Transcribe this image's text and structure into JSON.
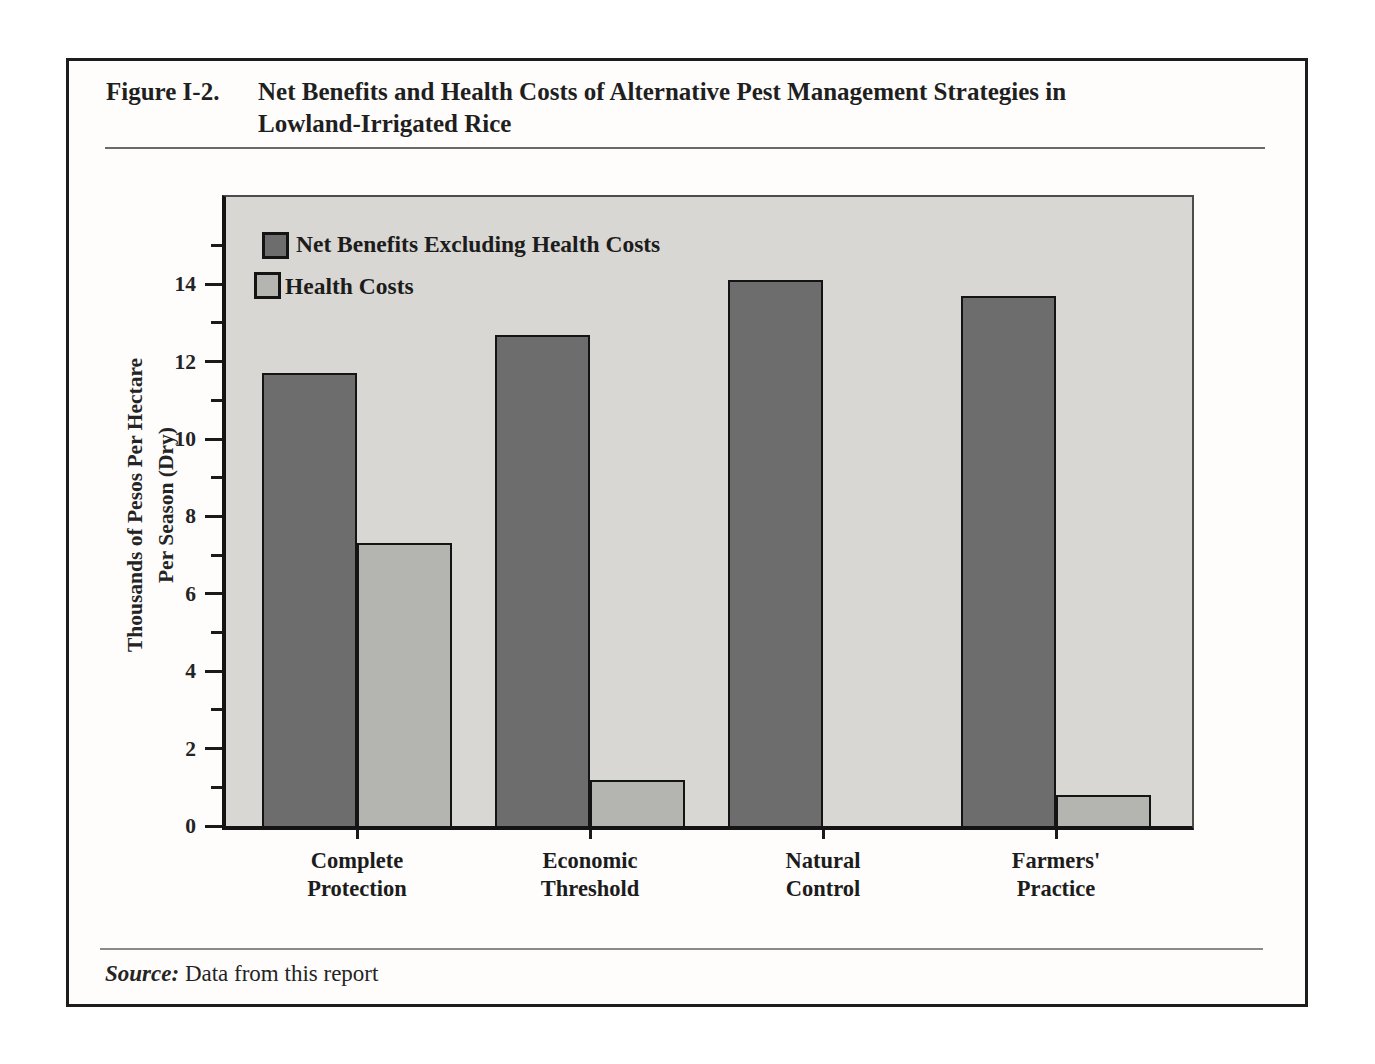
{
  "figure": {
    "label": "Figure I-2.",
    "title_line1": "Net Benefits and Health Costs of Alternative Pest Management Strategies in",
    "title_line2": "Lowland-Irrigated Rice",
    "source_label": "Source:",
    "source_text": "Data from this report"
  },
  "chart_data": {
    "type": "bar",
    "title": "Net Benefits and Health Costs of Alternative Pest Management Strategies in Lowland-Irrigated Rice",
    "categories": [
      "Complete Protection",
      "Economic Threshold",
      "Natural Control",
      "Farmers' Practice"
    ],
    "series": [
      {
        "name": "Net Benefits Excluding Health Costs",
        "values": [
          11.7,
          12.7,
          14.1,
          13.7
        ],
        "color": "#6d6d6d"
      },
      {
        "name": "Health Costs",
        "values": [
          7.3,
          1.2,
          0,
          0.8
        ],
        "color": "#b4b4b0"
      }
    ],
    "xlabel": "",
    "ylabel": "Thousands of Pesos Per Hectare Per Season (Dry)",
    "ylabel_lines": [
      "Thousands of Pesos Per Hectare",
      "Per Season (Dry)"
    ],
    "yticks": [
      0,
      2,
      4,
      6,
      8,
      10,
      12,
      14
    ],
    "minor_tick_interval": 1,
    "ylim": [
      0,
      16.3
    ],
    "grid": false,
    "legend_position": "top-left",
    "plot_background": "#d8d7d3",
    "bar_outline": "#141414",
    "source": "Data from this report"
  }
}
